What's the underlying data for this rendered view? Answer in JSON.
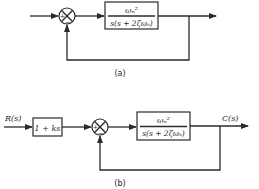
{
  "diagram_a": {
    "caption": "(a)",
    "summing_junction": {
      "plus_sign": "+",
      "minus_sign": "−"
    },
    "forward_block": {
      "numerator": "ωₙ²",
      "denominator": "s(s + 2ζωₙ)"
    }
  },
  "diagram_b": {
    "caption": "(b)",
    "input_label": "R(s)",
    "output_label": "C(s)",
    "prefilter_block": {
      "text": "1 + ks"
    },
    "summing_junction": {
      "plus_sign": "+",
      "minus_sign": "−"
    },
    "forward_block": {
      "numerator": "ωₙ²",
      "denominator": "s(s + 2ζωₙ)"
    }
  }
}
